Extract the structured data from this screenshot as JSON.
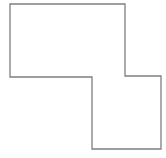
{
  "diagram": {
    "shape": "rectilinear-polygon",
    "stroke_color": "#7f7f7f",
    "fill_color": "#ffffff",
    "stroke_width": 1.3,
    "points": "10,4 125,4 125,76 161,76 161,149 92,149 92,77 10,77"
  }
}
